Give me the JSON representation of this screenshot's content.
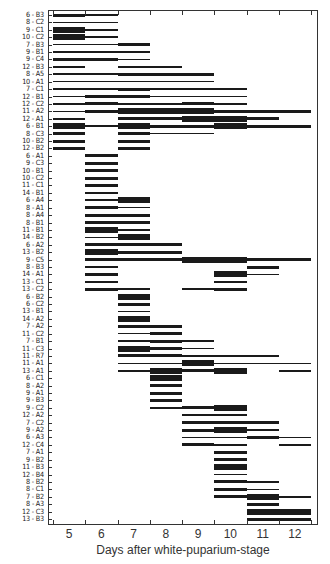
{
  "chart_data": {
    "type": "bar",
    "subtype": "gantt-timeline",
    "title": "",
    "xlabel": "Days after white-puparium-stage",
    "ylabel": "",
    "xlim": [
      4.5,
      12.5
    ],
    "x_ticks": [
      5,
      6,
      7,
      8,
      9,
      10,
      11,
      12
    ],
    "thickness_legend": {
      "1": "thin line",
      "2": "medium bar",
      "3": "thick bar"
    },
    "rows": [
      {
        "label": "6 - B3",
        "segments": [
          [
            4.5,
            5.5,
            2
          ],
          [
            5.5,
            6.5,
            1
          ]
        ]
      },
      {
        "label": "8 - C2",
        "segments": [
          [
            4.5,
            6.5,
            1
          ]
        ]
      },
      {
        "label": "9 - C1",
        "segments": [
          [
            4.5,
            5.5,
            3
          ],
          [
            5.5,
            6.5,
            1
          ]
        ]
      },
      {
        "label": "10 - C2",
        "segments": [
          [
            4.5,
            5.5,
            3
          ],
          [
            5.5,
            6.5,
            1
          ]
        ]
      },
      {
        "label": "7 - B3",
        "segments": [
          [
            4.5,
            6.5,
            1
          ],
          [
            6.5,
            7.5,
            2
          ]
        ]
      },
      {
        "label": "9 - B1",
        "segments": [
          [
            4.5,
            7.5,
            1
          ]
        ]
      },
      {
        "label": "9 - C4",
        "segments": [
          [
            4.5,
            6.5,
            2
          ],
          [
            6.5,
            7.5,
            1
          ]
        ]
      },
      {
        "label": "12 - B3",
        "segments": [
          [
            4.5,
            5.5,
            1
          ],
          [
            6.5,
            8.5,
            1
          ]
        ]
      },
      {
        "label": "8 - A5",
        "segments": [
          [
            4.5,
            6.5,
            1
          ],
          [
            6.5,
            9.5,
            2
          ]
        ]
      },
      {
        "label": "10 - A1",
        "segments": [
          [
            4.5,
            9.5,
            1
          ]
        ]
      },
      {
        "label": "7 - C1",
        "segments": [
          [
            4.5,
            6.5,
            1
          ],
          [
            6.5,
            7.5,
            2
          ],
          [
            7.5,
            10.5,
            1
          ]
        ]
      },
      {
        "label": "12 - B1",
        "segments": [
          [
            4.5,
            5.5,
            1
          ],
          [
            5.5,
            7.5,
            2
          ],
          [
            7.5,
            10.5,
            1
          ]
        ]
      },
      {
        "label": "12 - C2",
        "segments": [
          [
            4.5,
            5.5,
            1
          ],
          [
            5.5,
            6.5,
            2
          ],
          [
            6.5,
            8.5,
            1
          ],
          [
            8.5,
            9.5,
            2
          ],
          [
            9.5,
            10.5,
            1
          ]
        ]
      },
      {
        "label": "11 - A2",
        "segments": [
          [
            4.5,
            5.5,
            1
          ],
          [
            5.5,
            6.5,
            2
          ],
          [
            6.5,
            7.5,
            3
          ],
          [
            7.5,
            9.5,
            3
          ],
          [
            9.5,
            12.5,
            2
          ]
        ]
      },
      {
        "label": "12 - A1",
        "segments": [
          [
            4.5,
            5.5,
            1
          ],
          [
            6.5,
            7.5,
            2
          ],
          [
            7.5,
            8.5,
            2
          ],
          [
            8.5,
            10.5,
            3
          ],
          [
            10.5,
            11.5,
            2
          ]
        ]
      },
      {
        "label": "6 - B1",
        "segments": [
          [
            4.5,
            5.5,
            3
          ],
          [
            5.5,
            6.5,
            1
          ],
          [
            6.5,
            7.5,
            3
          ],
          [
            7.5,
            8.5,
            2
          ],
          [
            8.5,
            9.5,
            2
          ],
          [
            9.5,
            10.5,
            3
          ],
          [
            10.5,
            12.5,
            2
          ]
        ]
      },
      {
        "label": "8 - C3",
        "segments": [
          [
            4.5,
            5.5,
            2
          ],
          [
            6.5,
            7.5,
            2
          ],
          [
            7.5,
            9.5,
            1
          ]
        ]
      },
      {
        "label": "10 - B2",
        "segments": [
          [
            4.5,
            5.5,
            2
          ],
          [
            6.5,
            7.5,
            2
          ]
        ]
      },
      {
        "label": "12 - B2",
        "segments": [
          [
            4.5,
            5.5,
            2
          ],
          [
            6.5,
            7.5,
            2
          ]
        ]
      },
      {
        "label": "6 - A1",
        "segments": [
          [
            5.5,
            6.5,
            2
          ]
        ]
      },
      {
        "label": "9 - C3",
        "segments": [
          [
            5.5,
            6.5,
            2
          ]
        ]
      },
      {
        "label": "10 - B1",
        "segments": [
          [
            5.5,
            6.5,
            2
          ]
        ]
      },
      {
        "label": "10 - C2",
        "segments": [
          [
            5.5,
            6.5,
            2
          ]
        ]
      },
      {
        "label": "11 - C1",
        "segments": [
          [
            5.5,
            6.5,
            2
          ]
        ]
      },
      {
        "label": "14 - B1",
        "segments": [
          [
            5.5,
            6.5,
            1
          ]
        ]
      },
      {
        "label": "6 - A4",
        "segments": [
          [
            5.5,
            6.5,
            1
          ],
          [
            6.5,
            7.5,
            3
          ]
        ]
      },
      {
        "label": "8 - A1",
        "segments": [
          [
            5.5,
            6.5,
            2
          ],
          [
            6.5,
            7.5,
            1
          ]
        ]
      },
      {
        "label": "8 - A4",
        "segments": [
          [
            5.5,
            7.5,
            2
          ]
        ]
      },
      {
        "label": "8 - B1",
        "segments": [
          [
            5.5,
            7.5,
            2
          ]
        ]
      },
      {
        "label": "11 - B1",
        "segments": [
          [
            5.5,
            6.5,
            3
          ],
          [
            6.5,
            7.5,
            1
          ]
        ]
      },
      {
        "label": "14 - B2",
        "segments": [
          [
            5.5,
            6.5,
            1
          ],
          [
            6.5,
            7.5,
            3
          ]
        ]
      },
      {
        "label": "6 - A2",
        "segments": [
          [
            5.5,
            8.5,
            2
          ]
        ]
      },
      {
        "label": "13 - B2",
        "segments": [
          [
            5.5,
            6.5,
            3
          ],
          [
            6.5,
            8.5,
            2
          ]
        ]
      },
      {
        "label": "9 - C5",
        "segments": [
          [
            5.5,
            8.5,
            2
          ],
          [
            8.5,
            10.5,
            3
          ],
          [
            10.5,
            12.5,
            2
          ]
        ]
      },
      {
        "label": "8 - B3",
        "segments": [
          [
            5.5,
            6.5,
            1
          ],
          [
            10.5,
            11.5,
            2
          ]
        ]
      },
      {
        "label": "14 - A1",
        "segments": [
          [
            5.5,
            6.5,
            2
          ],
          [
            9.5,
            10.5,
            3
          ],
          [
            10.5,
            11.5,
            1
          ]
        ]
      },
      {
        "label": "13 - C1",
        "segments": [
          [
            5.5,
            6.5,
            1
          ],
          [
            9.5,
            10.5,
            1
          ]
        ]
      },
      {
        "label": "13 - C2",
        "segments": [
          [
            5.5,
            6.5,
            2
          ],
          [
            6.5,
            7.5,
            1
          ],
          [
            8.5,
            9.5,
            1
          ],
          [
            9.5,
            10.5,
            2
          ]
        ]
      },
      {
        "label": "6 - B2",
        "segments": [
          [
            6.5,
            7.5,
            3
          ]
        ]
      },
      {
        "label": "6 - C2",
        "segments": [
          [
            6.5,
            7.5,
            2
          ]
        ]
      },
      {
        "label": "13 - B1",
        "segments": [
          [
            6.5,
            7.5,
            1
          ]
        ]
      },
      {
        "label": "14 - A2",
        "segments": [
          [
            6.5,
            7.5,
            3
          ]
        ]
      },
      {
        "label": "7 - A2",
        "segments": [
          [
            6.5,
            8.5,
            2
          ]
        ]
      },
      {
        "label": "11 - C2",
        "segments": [
          [
            6.5,
            7.5,
            1
          ],
          [
            7.5,
            8.5,
            2
          ]
        ]
      },
      {
        "label": "7 - B1",
        "segments": [
          [
            6.5,
            7.5,
            1
          ],
          [
            7.5,
            8.5,
            2
          ],
          [
            8.5,
            9.5,
            1
          ]
        ]
      },
      {
        "label": "11 - C3",
        "segments": [
          [
            6.5,
            7.5,
            3
          ],
          [
            7.5,
            8.5,
            2
          ],
          [
            8.5,
            9.5,
            1
          ]
        ]
      },
      {
        "label": "11 - R7",
        "segments": [
          [
            6.5,
            8.5,
            2
          ],
          [
            8.5,
            11.5,
            1
          ]
        ]
      },
      {
        "label": "11 - A1",
        "segments": [
          [
            6.5,
            8.5,
            1
          ],
          [
            8.5,
            9.5,
            3
          ],
          [
            9.5,
            12.5,
            1
          ]
        ]
      },
      {
        "label": "13 - A1",
        "segments": [
          [
            6.5,
            7.5,
            1
          ],
          [
            7.5,
            8.5,
            3
          ],
          [
            8.5,
            9.5,
            2
          ],
          [
            9.5,
            10.5,
            3
          ],
          [
            11.5,
            12.5,
            1
          ]
        ]
      },
      {
        "label": "6 - C1",
        "segments": [
          [
            7.5,
            8.5,
            3
          ]
        ]
      },
      {
        "label": "8 - A2",
        "segments": [
          [
            7.5,
            8.5,
            2
          ]
        ]
      },
      {
        "label": "9 - A1",
        "segments": [
          [
            7.5,
            8.5,
            2
          ]
        ]
      },
      {
        "label": "9 - B3",
        "segments": [
          [
            7.5,
            8.5,
            2
          ]
        ]
      },
      {
        "label": "9 - C2",
        "segments": [
          [
            7.5,
            8.5,
            1
          ],
          [
            8.5,
            9.5,
            2
          ],
          [
            9.5,
            10.5,
            3
          ]
        ]
      },
      {
        "label": "12 - A2",
        "segments": [
          [
            8.5,
            10.5,
            1
          ]
        ]
      },
      {
        "label": "7 - C2",
        "segments": [
          [
            8.5,
            11.5,
            2
          ]
        ]
      },
      {
        "label": "9 - A2",
        "segments": [
          [
            8.5,
            9.5,
            2
          ],
          [
            9.5,
            10.5,
            3
          ],
          [
            10.5,
            11.5,
            1
          ]
        ]
      },
      {
        "label": "6 - A3",
        "segments": [
          [
            8.5,
            10.5,
            1
          ],
          [
            10.5,
            11.5,
            2
          ],
          [
            11.5,
            12.5,
            1
          ]
        ]
      },
      {
        "label": "12 - C4",
        "segments": [
          [
            8.5,
            9.5,
            2
          ],
          [
            9.5,
            10.5,
            1
          ],
          [
            11.5,
            12.5,
            1
          ]
        ]
      },
      {
        "label": "7 - A1",
        "segments": [
          [
            9.5,
            10.5,
            2
          ]
        ]
      },
      {
        "label": "9 - B2",
        "segments": [
          [
            9.5,
            10.5,
            2
          ]
        ]
      },
      {
        "label": "11 - B3",
        "segments": [
          [
            9.5,
            10.5,
            3
          ]
        ]
      },
      {
        "label": "12 - B4",
        "segments": [
          [
            9.5,
            10.5,
            1
          ]
        ]
      },
      {
        "label": "8 - B2",
        "segments": [
          [
            9.5,
            10.5,
            2
          ],
          [
            10.5,
            11.5,
            1
          ]
        ]
      },
      {
        "label": "8 - C1",
        "segments": [
          [
            9.5,
            10.5,
            2
          ],
          [
            10.5,
            11.5,
            1
          ]
        ]
      },
      {
        "label": "7 - B2",
        "segments": [
          [
            9.5,
            10.5,
            2
          ],
          [
            10.5,
            11.5,
            3
          ],
          [
            11.5,
            12.5,
            1
          ]
        ]
      },
      {
        "label": "8 - A3",
        "segments": [
          [
            10.5,
            11.5,
            2
          ]
        ]
      },
      {
        "label": "12 - C3",
        "segments": [
          [
            10.5,
            12.5,
            3
          ]
        ]
      },
      {
        "label": "13 - B3",
        "segments": [
          [
            10.5,
            12.5,
            2
          ]
        ]
      }
    ]
  },
  "colors": {
    "bar": "#1a1a1a",
    "axis": "#333333",
    "background": "#ffffff"
  }
}
